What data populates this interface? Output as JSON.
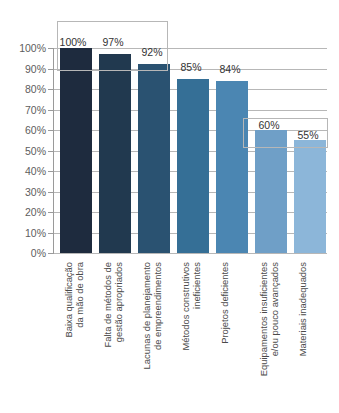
{
  "chart_data": {
    "type": "bar",
    "title": "",
    "subtitle": "",
    "xlabel": "",
    "ylabel": "",
    "ylim": [
      0,
      100
    ],
    "grid": true,
    "legend": "none",
    "orientation": "vertical",
    "value_suffix": "%",
    "categories": [
      "Baixa qualificação da mão de obra",
      "Falta de métodos de gestão apropriados",
      "Lacunas de planejamento de empreendimentos",
      "Métodos construtivos ineficientes",
      "Projetos deficientes",
      "Equipamentos insuficientes e/ou pouco avançados",
      "Materiais inadequados"
    ],
    "category_lines": [
      [
        "Baixa qualificação",
        "da mão de obra"
      ],
      [
        "Falta de métodos de",
        "gestão apropriados"
      ],
      [
        "Lacunas de planejamento",
        "de empreendimentos"
      ],
      [
        "Métodos construtivos",
        "ineficientes"
      ],
      [
        "Projetos deficientes",
        ""
      ],
      [
        "Equipamentos insuficientes",
        "e/ou pouco avançados"
      ],
      [
        "Materiais inadequados",
        ""
      ]
    ],
    "values": [
      100,
      97,
      92,
      85,
      84,
      60,
      55
    ],
    "value_labels": [
      "100%",
      "97%",
      "92%",
      "85%",
      "84%",
      "60%",
      "55%"
    ],
    "bar_colors": [
      "#1e2b3e",
      "#21394f",
      "#2a5271",
      "#356f96",
      "#4b86b2",
      "#6f9fc7",
      "#8cb6d9"
    ],
    "yticks": [
      0,
      10,
      20,
      30,
      40,
      50,
      60,
      70,
      80,
      90,
      100
    ],
    "ytick_labels": [
      "0%",
      "10%",
      "20%",
      "30%",
      "40%",
      "50%",
      "60%",
      "70%",
      "80%",
      "90%",
      "100%"
    ],
    "annotations": [
      {
        "name": "highlight-box-top-group",
        "covers": [
          "Baixa qualificação da mão de obra",
          "Falta de métodos de gestão apropriados",
          "Lacunas de planejamento de empreendimentos"
        ],
        "label": "",
        "border_color": "#7b7b7b"
      },
      {
        "name": "highlight-box-bottom-group",
        "covers": [
          "Equipamentos insuficientes e/ou pouco avançados",
          "Materiais inadequados"
        ],
        "label": "",
        "border_color": "#7b7b7b"
      }
    ],
    "colors": {
      "gridline": "#b7b7b7",
      "axis": "#9a9a9a",
      "tick_text": "#5d5d5d",
      "value_text": "#333333",
      "category_text": "#4a4a4a",
      "background": "#ffffff"
    }
  }
}
